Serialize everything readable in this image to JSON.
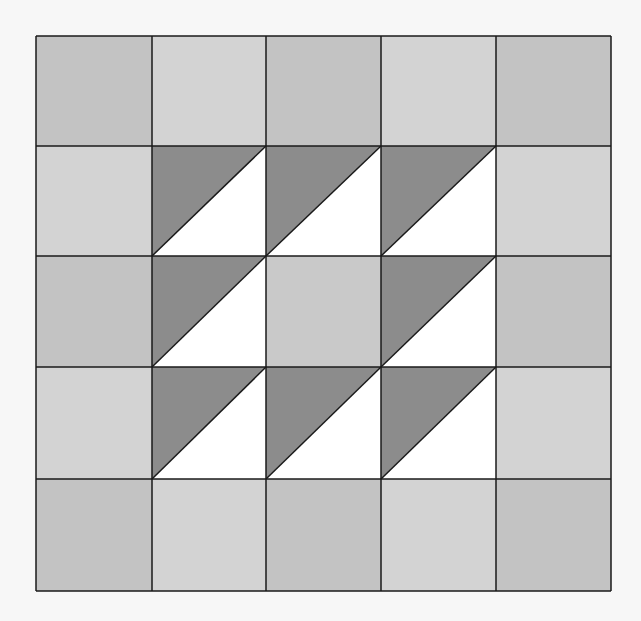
{
  "quilt": {
    "title": "",
    "rows": 5,
    "cols": 5,
    "origin": [
      36,
      36
    ],
    "col_edges": [
      36,
      152,
      266,
      381,
      496,
      611
    ],
    "row_edges": [
      36,
      146,
      256,
      367,
      479,
      591
    ],
    "colors": {
      "dark_gray_square": "#c3c3c3",
      "light_gray_square": "#d3d3d3",
      "center_square": "#c9c9c9",
      "triangle_dark": "#8c8c8c",
      "triangle_light": "#ffffff",
      "line": "#1a1a1a",
      "background": "#f7f7f7"
    },
    "cells": [
      [
        "dark",
        "light",
        "dark",
        "light",
        "dark"
      ],
      [
        "light",
        "tri",
        "tri",
        "tri",
        "light"
      ],
      [
        "dark",
        "tri",
        "center",
        "tri",
        "dark"
      ],
      [
        "light",
        "tri",
        "tri",
        "tri",
        "light"
      ],
      [
        "dark",
        "light",
        "dark",
        "light",
        "dark"
      ]
    ]
  }
}
